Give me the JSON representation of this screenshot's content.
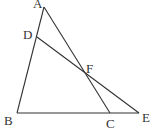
{
  "diagram": {
    "type": "geometry-figure",
    "points": {
      "A": {
        "label": "A",
        "x": 44,
        "y": 7,
        "lx": 33,
        "ly": 8
      },
      "B": {
        "label": "B",
        "x": 17,
        "y": 113,
        "lx": 4,
        "ly": 125
      },
      "C": {
        "label": "C",
        "x": 110,
        "y": 113,
        "lx": 106,
        "ly": 128
      },
      "D": {
        "label": "D",
        "x": 37,
        "y": 37,
        "lx": 23,
        "ly": 39
      },
      "E": {
        "label": "E",
        "x": 139,
        "y": 113,
        "lx": 142,
        "ly": 122
      },
      "F": {
        "label": "F",
        "x": 87,
        "y": 75,
        "lx": 86,
        "ly": 73
      }
    },
    "segments": [
      [
        "A",
        "B"
      ],
      [
        "A",
        "C"
      ],
      [
        "B",
        "E"
      ],
      [
        "D",
        "E"
      ]
    ],
    "colors": {
      "stroke": "#333333",
      "label": "#333333",
      "background": "#ffffff"
    }
  }
}
